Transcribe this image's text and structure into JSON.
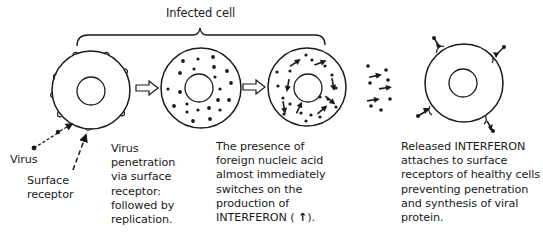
{
  "diagram": {
    "type": "biological process diagram",
    "colors": {
      "ink": "#1a1a1a",
      "background": "#ffffff"
    }
  },
  "bracket": {
    "label": "Infected cell"
  },
  "labels": {
    "virus": "Virus",
    "surface_receptor": "Surface\nreceptor",
    "step1": "Virus\npenetration\nvia surface\nreceptor:\nfollowed by\nreplication.",
    "step2_pre": "The presence of\nforeign nucleic acid\nalmost immediately\nswitches on the\nproduction of\nINTERFERON ( ",
    "step2_icon": "↑",
    "step2_post": ").",
    "step3": "Released INTERFERON\nattaches to surface\nreceptors of healthy cells\npreventing penetration\nand synthesis of viral\nprotein."
  },
  "stages": [
    {
      "name": "healthy-cell-with-receptors",
      "description": "Cell with surface receptors; virus attaching"
    },
    {
      "name": "replicating-cell",
      "description": "Cell filled with viral particles (dots)"
    },
    {
      "name": "interferon-producing-cell",
      "description": "Cell with viral particles and interferon (arrows)"
    },
    {
      "name": "released-interferon",
      "description": "Interferon and particles released"
    },
    {
      "name": "protected-healthy-cell",
      "description": "Healthy cell with interferon bound to receptors"
    }
  ],
  "icons": {
    "process_arrow": "hollow-right-arrow",
    "interferon_symbol": "arrow-up-icon"
  }
}
